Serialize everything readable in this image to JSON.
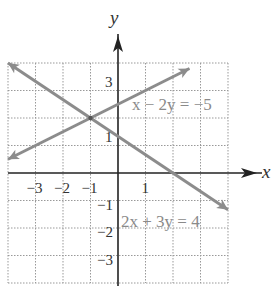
{
  "chart_data": {
    "type": "line",
    "title": "",
    "xlabel": "x",
    "ylabel": "y",
    "xlim": [
      -4,
      4
    ],
    "ylim": [
      -4,
      4
    ],
    "grid": true,
    "x_ticks": [
      "-3",
      "-2",
      "-1",
      "1"
    ],
    "y_ticks": [
      "3",
      "1",
      "-1",
      "-2",
      "-3"
    ],
    "series": [
      {
        "name": "x - 2y = -5",
        "label": "x − 2y = −5",
        "slope": 0.5,
        "intercept": 2.5,
        "x": [
          -4,
          2.6
        ],
        "y": [
          0.5,
          3.8
        ]
      },
      {
        "name": "2x + 3y = 4",
        "label": "2x + 3y = 4",
        "slope": -0.6667,
        "intercept": 1.3333,
        "x": [
          -4,
          4
        ],
        "y": [
          4,
          -1.3333
        ]
      }
    ],
    "annotations": [
      {
        "text": "intersection",
        "x": -1,
        "y": 2
      }
    ]
  }
}
